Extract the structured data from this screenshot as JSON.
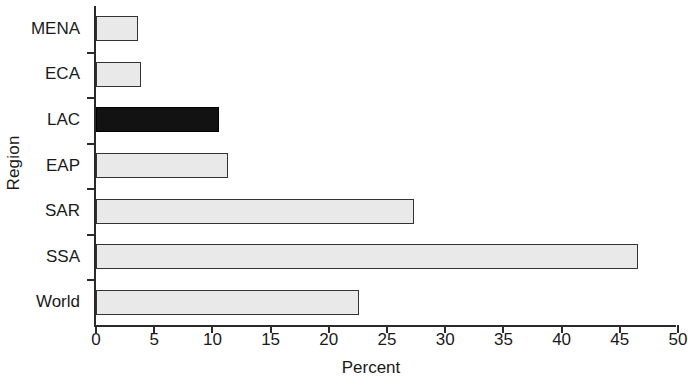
{
  "chart_data": {
    "type": "bar",
    "orientation": "horizontal",
    "title": "",
    "xlabel": "Percent",
    "ylabel": "Region",
    "categories": [
      "MENA",
      "ECA",
      "LAC",
      "EAP",
      "SAR",
      "SSA",
      "World"
    ],
    "values": [
      3.6,
      3.9,
      10.6,
      11.3,
      27.3,
      46.6,
      22.6
    ],
    "highlighted_category": "LAC",
    "series": [
      {
        "name": "Percent",
        "values": [
          3.6,
          3.9,
          10.6,
          11.3,
          27.3,
          46.6,
          22.6
        ]
      }
    ],
    "xlim": [
      0,
      50
    ],
    "xticks": [
      0,
      5,
      10,
      15,
      20,
      25,
      30,
      35,
      40,
      45,
      50
    ],
    "xtick_labels": [
      "0",
      "5",
      "10",
      "15",
      "20",
      "25",
      "30",
      "35",
      "40",
      "45",
      "50"
    ],
    "grid": false,
    "legend": false,
    "bar_fill_color": "#e9e9e9",
    "bar_highlight_color": "#121212",
    "bar_border_color": "#333333",
    "axis_color": "#2a2a2a"
  }
}
